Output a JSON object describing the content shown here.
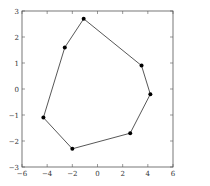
{
  "chart_data": {
    "type": "line",
    "subtype": "closed-polygon",
    "title": "",
    "xlabel": "",
    "ylabel": "",
    "xlim": [
      -6,
      6
    ],
    "ylim": [
      -3,
      3
    ],
    "grid": false,
    "legend": null,
    "x_ticks": [
      -6,
      -4,
      -2,
      0,
      2,
      4,
      6
    ],
    "y_ticks": [
      -3,
      -2,
      -1,
      0,
      1,
      2,
      3
    ],
    "x_tick_labels": [
      "−6",
      "−4",
      "−2",
      "0",
      "2",
      "4",
      "6"
    ],
    "y_tick_labels": [
      "−3",
      "−2",
      "−1",
      "0",
      "1",
      "2",
      "3"
    ],
    "series": [
      {
        "name": "polygon",
        "closed": true,
        "marker": "circle",
        "color": "#000000",
        "points": [
          {
            "x": -1.1,
            "y": 2.7
          },
          {
            "x": 3.5,
            "y": 0.9
          },
          {
            "x": 4.2,
            "y": -0.2
          },
          {
            "x": 2.6,
            "y": -1.7
          },
          {
            "x": -2.0,
            "y": -2.3
          },
          {
            "x": -4.3,
            "y": -1.1
          },
          {
            "x": -2.6,
            "y": 1.6
          }
        ]
      }
    ]
  },
  "style": {
    "axis_color": "#555555",
    "line_color": "#444444",
    "marker_color": "#000000"
  }
}
